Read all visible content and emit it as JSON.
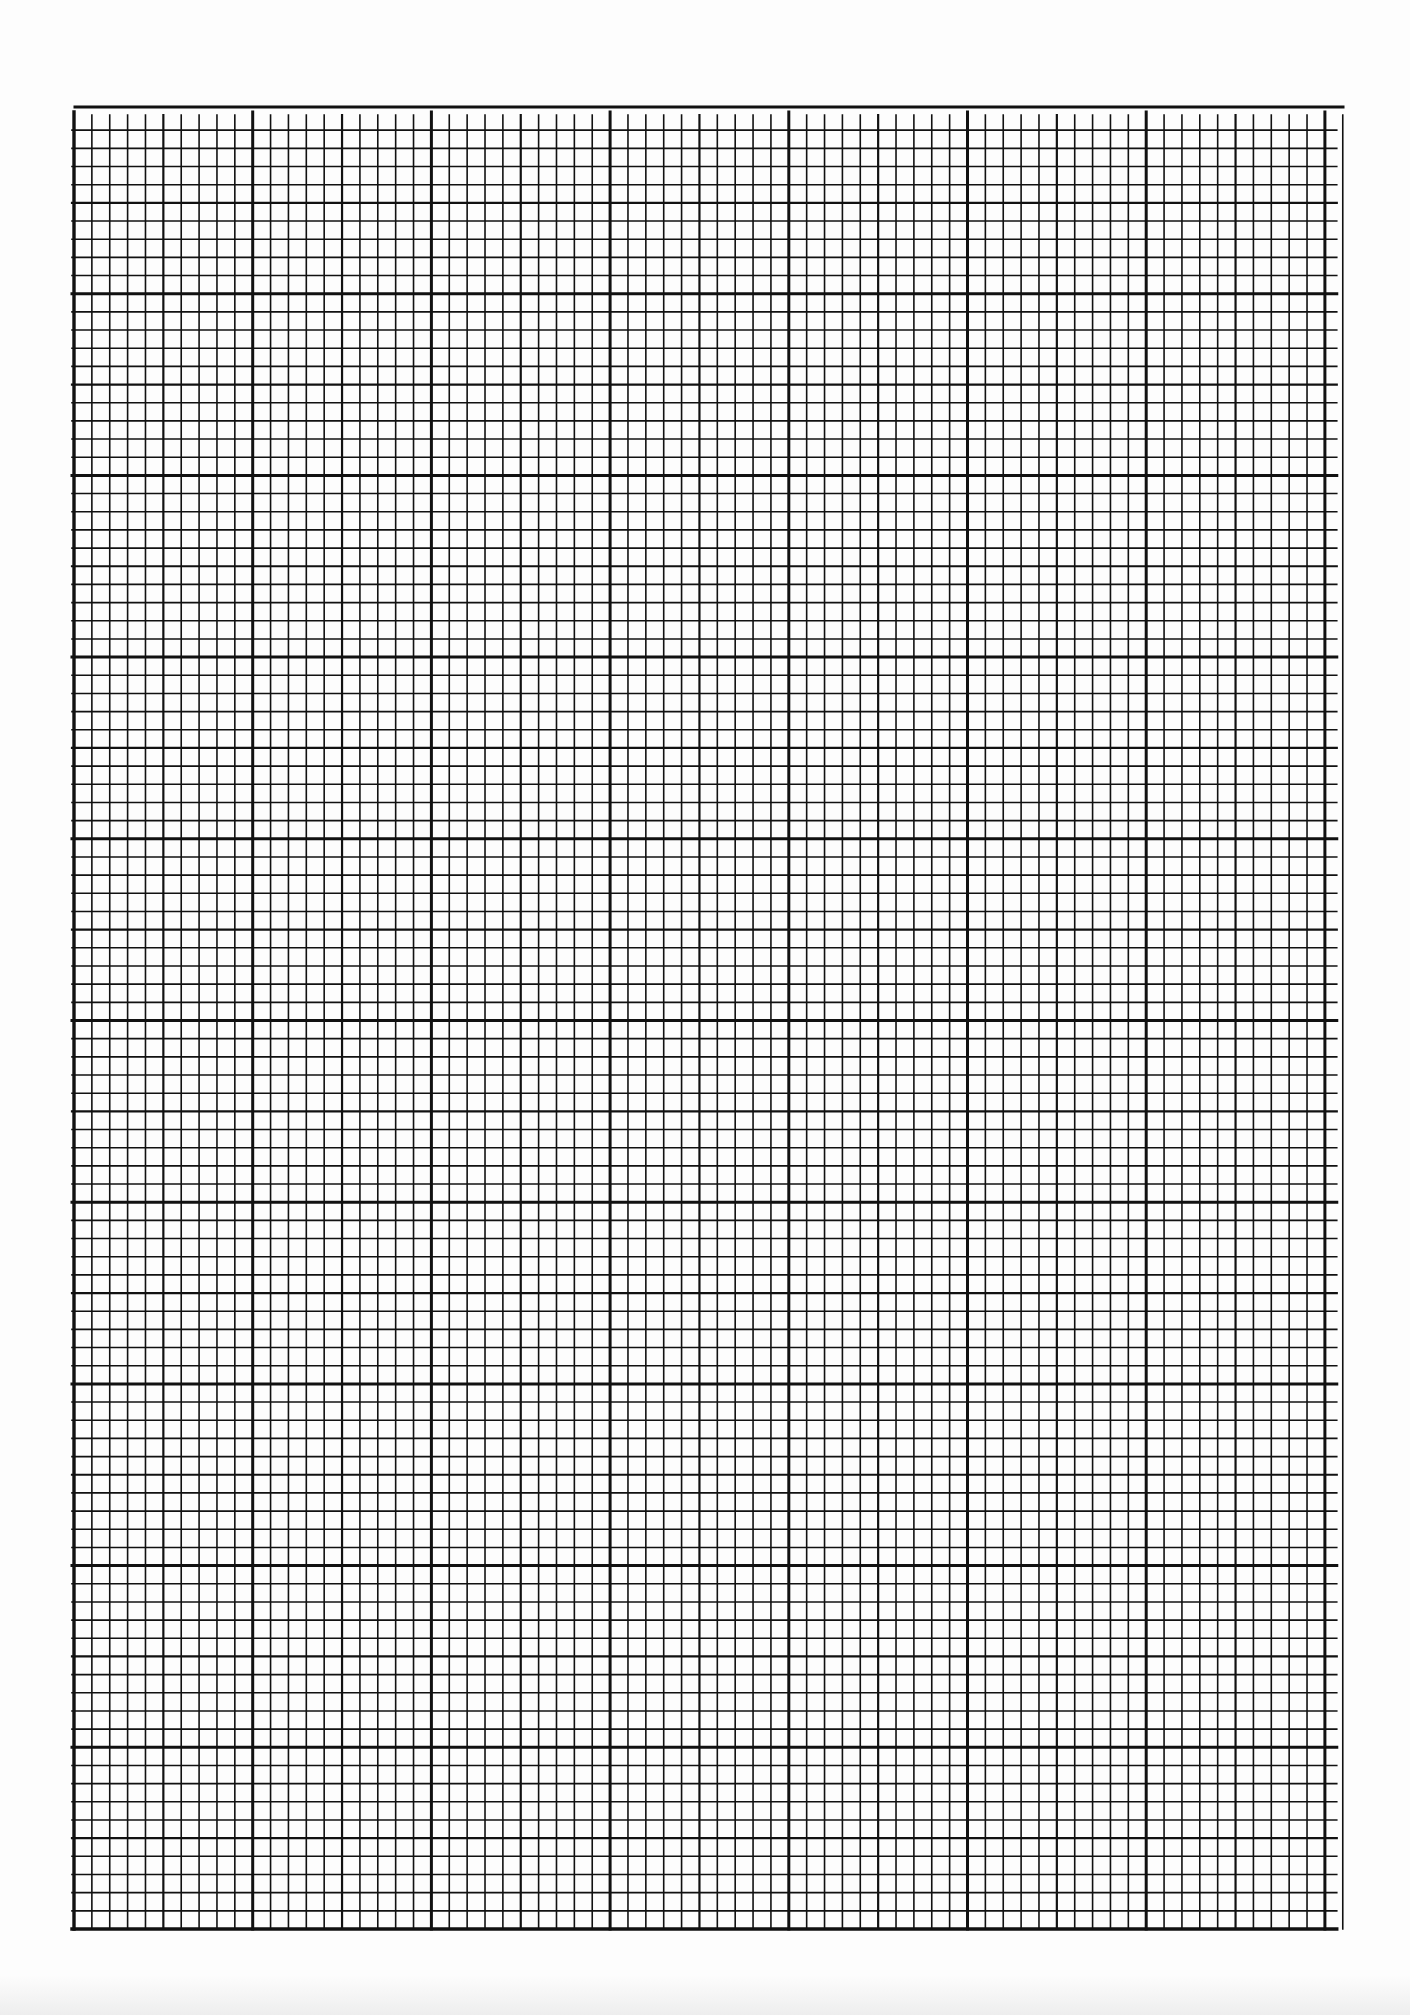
{
  "document": {
    "type": "graph-paper",
    "description": "Blank scanned sheet of millimetre-style graph paper with no text or markings",
    "colors": {
      "paper": "#fdfdfd",
      "ink": "#111111"
    },
    "grid": {
      "top_rule": {
        "x1": 75,
        "x2": 1343,
        "y": 107,
        "width": 3
      },
      "left": 74,
      "right": 1343,
      "top": 113,
      "bottom": 1929,
      "major_col_pitch": 178.7,
      "major_row_pitch": 181.7,
      "minor_per_major": 10,
      "major_cols": 7,
      "extra_minor_cols": 1,
      "major_rows_below_top": 9,
      "line_widths": {
        "minor": 1.6,
        "medium": 2.2,
        "major": 3.0,
        "border": 3.4
      }
    }
  }
}
